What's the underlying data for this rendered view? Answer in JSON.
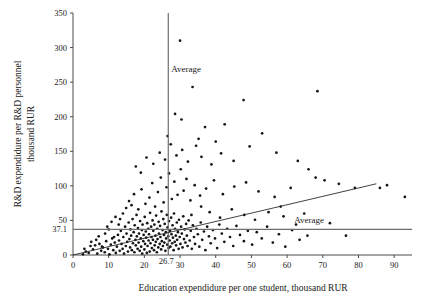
{
  "chart_data": {
    "type": "scatter",
    "title": "",
    "xlabel": "Education expendidure per one student, thousand RUR",
    "ylabel": "R&D expendidure per R&D personnel thousand RUR",
    "xlim": [
      0,
      95
    ],
    "ylim": [
      0,
      350
    ],
    "xticks": [
      0,
      10,
      20,
      30,
      40,
      50,
      60,
      70,
      80,
      90
    ],
    "xtick_labels": [
      "0",
      "10",
      "20",
      "30",
      "40",
      "50",
      "60",
      "70",
      "80",
      "90"
    ],
    "yticks": [
      0,
      50,
      100,
      150,
      200,
      250,
      300,
      350
    ],
    "ytick_labels": [
      "0",
      "50",
      "100",
      "150",
      "200",
      "250",
      "300",
      "350"
    ],
    "grid": false,
    "legend": "none",
    "annotations": [
      {
        "text": "Average",
        "kind": "vertical-average-label",
        "x": 27.5,
        "y": 265
      },
      {
        "text": "Average",
        "kind": "horizontal-average-label",
        "x": 62.0,
        "y": 47
      }
    ],
    "reference_lines": [
      {
        "orientation": "vertical",
        "value": 26.7,
        "label": "26.7",
        "name": "x-average-line"
      },
      {
        "orientation": "horizontal",
        "value": 37.1,
        "label": "37.1",
        "name": "y-average-line"
      }
    ],
    "trend_line": {
      "x0": 0.0,
      "y0": 0.0,
      "x1": 85.0,
      "y1": 103.0,
      "name": "regression-line"
    },
    "special_tick_x": "26.7",
    "special_tick_y": "37.1",
    "points": [
      [
        3.6,
        5.0
      ],
      [
        4.4,
        3.0
      ],
      [
        4.9,
        13.0
      ],
      [
        5.6,
        8.0
      ],
      [
        6.2,
        14.0
      ],
      [
        6.8,
        2.0
      ],
      [
        7.4,
        16.0
      ],
      [
        7.9,
        6.0
      ],
      [
        8.4,
        11.0
      ],
      [
        8.9,
        4.0
      ],
      [
        9.3,
        20.0
      ],
      [
        9.8,
        9.0
      ],
      [
        10.2,
        1.0
      ],
      [
        10.6,
        15.0
      ],
      [
        11.0,
        24.0
      ],
      [
        11.3,
        7.0
      ],
      [
        11.7,
        18.0
      ],
      [
        12.0,
        3.0
      ],
      [
        12.3,
        12.0
      ],
      [
        12.6,
        29.0
      ],
      [
        12.9,
        21.0
      ],
      [
        13.1,
        6.0
      ],
      [
        13.4,
        35.0
      ],
      [
        13.6,
        16.0
      ],
      [
        13.9,
        9.0
      ],
      [
        14.1,
        26.0
      ],
      [
        14.3,
        2.0
      ],
      [
        14.6,
        41.0
      ],
      [
        14.8,
        13.0
      ],
      [
        15.0,
        31.0
      ],
      [
        15.2,
        19.0
      ],
      [
        15.4,
        5.0
      ],
      [
        15.6,
        47.0
      ],
      [
        15.8,
        23.0
      ],
      [
        16.0,
        11.0
      ],
      [
        16.1,
        37.0
      ],
      [
        16.3,
        28.0
      ],
      [
        16.5,
        7.0
      ],
      [
        16.7,
        52.0
      ],
      [
        16.8,
        17.0
      ],
      [
        17.0,
        33.0
      ],
      [
        17.2,
        4.0
      ],
      [
        17.3,
        43.0
      ],
      [
        17.5,
        22.0
      ],
      [
        17.6,
        14.0
      ],
      [
        17.8,
        58.0
      ],
      [
        17.9,
        27.0
      ],
      [
        18.1,
        9.0
      ],
      [
        18.2,
        39.0
      ],
      [
        18.4,
        18.0
      ],
      [
        18.5,
        31.0
      ],
      [
        18.7,
        6.0
      ],
      [
        18.8,
        49.0
      ],
      [
        19.0,
        24.0
      ],
      [
        19.1,
        12.0
      ],
      [
        19.3,
        36.0
      ],
      [
        19.4,
        2.0
      ],
      [
        19.5,
        44.0
      ],
      [
        19.7,
        20.0
      ],
      [
        19.8,
        29.0
      ],
      [
        20.0,
        8.0
      ],
      [
        20.1,
        55.0
      ],
      [
        20.2,
        16.0
      ],
      [
        20.4,
        34.0
      ],
      [
        20.5,
        25.0
      ],
      [
        20.7,
        3.0
      ],
      [
        20.8,
        46.0
      ],
      [
        20.9,
        13.0
      ],
      [
        21.1,
        38.0
      ],
      [
        21.2,
        21.0
      ],
      [
        21.3,
        30.0
      ],
      [
        21.5,
        5.0
      ],
      [
        21.6,
        61.0
      ],
      [
        21.7,
        17.0
      ],
      [
        21.9,
        41.0
      ],
      [
        22.0,
        26.0
      ],
      [
        22.1,
        10.0
      ],
      [
        22.3,
        50.0
      ],
      [
        22.4,
        22.0
      ],
      [
        22.5,
        35.0
      ],
      [
        22.7,
        7.0
      ],
      [
        22.8,
        44.0
      ],
      [
        22.9,
        14.0
      ],
      [
        23.1,
        28.0
      ],
      [
        23.2,
        19.0
      ],
      [
        23.3,
        57.0
      ],
      [
        23.5,
        4.0
      ],
      [
        23.6,
        38.0
      ],
      [
        23.7,
        23.0
      ],
      [
        23.9,
        11.0
      ],
      [
        24.0,
        48.0
      ],
      [
        24.1,
        31.0
      ],
      [
        24.3,
        16.0
      ],
      [
        24.4,
        42.0
      ],
      [
        24.5,
        26.0
      ],
      [
        24.7,
        8.0
      ],
      [
        24.8,
        63.0
      ],
      [
        24.9,
        20.0
      ],
      [
        25.1,
        36.0
      ],
      [
        25.2,
        13.0
      ],
      [
        25.3,
        52.0
      ],
      [
        25.5,
        29.0
      ],
      [
        25.6,
        18.0
      ],
      [
        25.7,
        45.0
      ],
      [
        25.9,
        6.0
      ],
      [
        26.0,
        33.0
      ],
      [
        26.1,
        24.0
      ],
      [
        26.3,
        58.0
      ],
      [
        26.4,
        15.0
      ],
      [
        26.5,
        40.0
      ],
      [
        26.7,
        27.0
      ],
      [
        26.8,
        10.0
      ],
      [
        26.9,
        49.0
      ],
      [
        27.1,
        21.0
      ],
      [
        27.2,
        35.0
      ],
      [
        27.3,
        12.0
      ],
      [
        27.5,
        54.0
      ],
      [
        27.6,
        30.0
      ],
      [
        27.8,
        17.0
      ],
      [
        27.9,
        43.0
      ],
      [
        28.0,
        25.0
      ],
      [
        28.2,
        7.0
      ],
      [
        28.3,
        60.0
      ],
      [
        28.5,
        19.0
      ],
      [
        28.6,
        38.0
      ],
      [
        28.8,
        28.0
      ],
      [
        28.9,
        14.0
      ],
      [
        29.1,
        47.0
      ],
      [
        29.2,
        22.0
      ],
      [
        29.4,
        33.0
      ],
      [
        29.6,
        9.0
      ],
      [
        29.7,
        51.0
      ],
      [
        29.9,
        26.0
      ],
      [
        30.1,
        16.0
      ],
      [
        30.3,
        41.0
      ],
      [
        30.5,
        31.0
      ],
      [
        30.7,
        11.0
      ],
      [
        30.9,
        56.0
      ],
      [
        31.1,
        23.0
      ],
      [
        31.3,
        37.0
      ],
      [
        31.5,
        18.0
      ],
      [
        31.7,
        45.0
      ],
      [
        31.9,
        28.0
      ],
      [
        32.1,
        13.0
      ],
      [
        32.4,
        50.0
      ],
      [
        32.7,
        21.0
      ],
      [
        33.0,
        35.0
      ],
      [
        33.3,
        9.0
      ],
      [
        33.6,
        43.0
      ],
      [
        33.9,
        26.0
      ],
      [
        34.2,
        16.0
      ],
      [
        34.6,
        38.0
      ],
      [
        35.0,
        30.0
      ],
      [
        35.4,
        12.0
      ],
      [
        35.8,
        47.0
      ],
      [
        36.2,
        22.0
      ],
      [
        36.7,
        34.0
      ],
      [
        37.1,
        7.0
      ],
      [
        37.6,
        41.0
      ],
      [
        38.1,
        27.0
      ],
      [
        38.6,
        17.0
      ],
      [
        39.2,
        36.0
      ],
      [
        39.8,
        24.0
      ],
      [
        40.4,
        10.0
      ],
      [
        41.0,
        44.0
      ],
      [
        41.7,
        31.0
      ],
      [
        42.4,
        19.0
      ],
      [
        43.2,
        38.0
      ],
      [
        44.0,
        26.0
      ],
      [
        44.9,
        13.0
      ],
      [
        45.8,
        42.0
      ],
      [
        46.8,
        29.0
      ],
      [
        47.9,
        20.0
      ],
      [
        49.0,
        35.0
      ],
      [
        50.2,
        15.0
      ],
      [
        51.5,
        33.0
      ],
      [
        52.9,
        24.0
      ],
      [
        54.4,
        41.0
      ],
      [
        56.0,
        18.0
      ],
      [
        57.7,
        30.0
      ],
      [
        59.5,
        12.0
      ],
      [
        61.4,
        36.0
      ],
      [
        63.5,
        22.0
      ],
      [
        65.7,
        28.0
      ],
      [
        14.9,
        68.0
      ],
      [
        15.7,
        78.0
      ],
      [
        16.4,
        72.0
      ],
      [
        17.1,
        88.0
      ],
      [
        18.3,
        66.0
      ],
      [
        19.2,
        95.0
      ],
      [
        20.3,
        74.0
      ],
      [
        21.4,
        83.0
      ],
      [
        22.2,
        104.0
      ],
      [
        23.0,
        70.0
      ],
      [
        23.8,
        91.0
      ],
      [
        24.6,
        112.0
      ],
      [
        25.4,
        76.0
      ],
      [
        26.2,
        98.0
      ],
      [
        26.9,
        118.0
      ],
      [
        27.7,
        81.0
      ],
      [
        28.4,
        106.0
      ],
      [
        29.3,
        87.0
      ],
      [
        30.2,
        124.0
      ],
      [
        31.0,
        93.0
      ],
      [
        31.8,
        110.0
      ],
      [
        32.9,
        79.0
      ],
      [
        34.1,
        101.0
      ],
      [
        35.6,
        86.0
      ],
      [
        37.3,
        96.0
      ],
      [
        39.5,
        108.0
      ],
      [
        42.0,
        88.0
      ],
      [
        45.2,
        99.0
      ],
      [
        48.5,
        105.0
      ],
      [
        52.0,
        92.0
      ],
      [
        56.5,
        84.0
      ],
      [
        61.0,
        97.0
      ],
      [
        68.0,
        112.0
      ],
      [
        74.5,
        103.0
      ],
      [
        79.0,
        97.0
      ],
      [
        88.0,
        101.0
      ],
      [
        93.0,
        84.0
      ],
      [
        22.5,
        132.0
      ],
      [
        24.3,
        148.0
      ],
      [
        25.8,
        138.0
      ],
      [
        27.4,
        160.0
      ],
      [
        29.0,
        144.0
      ],
      [
        30.6,
        152.0
      ],
      [
        32.2,
        135.0
      ],
      [
        34.5,
        158.0
      ],
      [
        36.0,
        142.0
      ],
      [
        38.8,
        131.0
      ],
      [
        41.5,
        147.0
      ],
      [
        45.0,
        136.0
      ],
      [
        17.6,
        128.0
      ],
      [
        19.0,
        119.0
      ],
      [
        20.6,
        141.0
      ],
      [
        30.0,
        310.0
      ],
      [
        33.5,
        243.0
      ],
      [
        28.6,
        204.0
      ],
      [
        30.4,
        196.0
      ],
      [
        37.0,
        185.0
      ],
      [
        42.5,
        189.0
      ],
      [
        47.8,
        224.0
      ],
      [
        53.0,
        176.0
      ],
      [
        26.5,
        172.0
      ],
      [
        35.2,
        168.0
      ],
      [
        40.0,
        164.0
      ],
      [
        49.5,
        157.0
      ],
      [
        57.0,
        148.0
      ],
      [
        63.0,
        136.0
      ],
      [
        68.5,
        237.0
      ],
      [
        66.0,
        124.0
      ],
      [
        70.5,
        108.0
      ],
      [
        72.0,
        46.0
      ],
      [
        76.5,
        28.0
      ],
      [
        86.0,
        97.0
      ],
      [
        2.8,
        1.0
      ],
      [
        3.2,
        9.0
      ],
      [
        5.1,
        19.0
      ],
      [
        6.5,
        22.0
      ],
      [
        7.2,
        27.0
      ],
      [
        8.1,
        12.0
      ],
      [
        9.0,
        31.0
      ],
      [
        10.0,
        37.0
      ],
      [
        11.5,
        26.0
      ],
      [
        12.8,
        44.0
      ],
      [
        13.2,
        52.0
      ],
      [
        14.0,
        60.0
      ],
      [
        11.9,
        55.0
      ],
      [
        10.8,
        48.0
      ],
      [
        9.6,
        41.0
      ],
      [
        59.0,
        56.0
      ],
      [
        62.5,
        44.0
      ],
      [
        64.8,
        60.0
      ],
      [
        58.2,
        70.0
      ],
      [
        54.8,
        62.0
      ],
      [
        51.0,
        51.0
      ],
      [
        48.0,
        58.0
      ],
      [
        44.5,
        66.0
      ],
      [
        41.2,
        54.0
      ],
      [
        38.3,
        62.0
      ],
      [
        35.9,
        70.0
      ],
      [
        33.2,
        58.0
      ]
    ]
  },
  "axis": {
    "y_title": "R&D expendidure per R&D personnel thousand RUR",
    "y_title_line1": "R&D expendidure per R&D personnel",
    "y_title_line2": "thousand RUR",
    "x_title": "Education expendidure per one student, thousand RUR"
  },
  "labels": {
    "average_vertical": "Average",
    "average_horizontal": "Average",
    "x_average_value": "26.7",
    "y_average_value": "37.1"
  },
  "colors": {
    "point": "#141414",
    "average_line": "#6e6e6e",
    "trend_line": "#2b2b2b",
    "axis": "#4a4a4a",
    "background": "#ffffff"
  }
}
